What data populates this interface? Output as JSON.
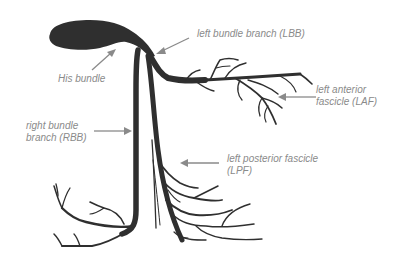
{
  "diagram": {
    "colors": {
      "structure": "#2f2f2f",
      "label_text": "#8a8a8a",
      "arrow": "#8a8a8a",
      "background": "#ffffff"
    },
    "labels": {
      "his_bundle": "His bundle",
      "lbb": "left bundle branch (LBB)",
      "laf": "left anterior\nfascicle (LAF)",
      "rbb": "right bundle\nbranch (RBB)",
      "lpf": "left posterior fascicle\n(LPF)"
    },
    "annotations": [
      {
        "id": "his_bundle",
        "text": "His bundle",
        "arrow_direction": "up-right"
      },
      {
        "id": "lbb",
        "text": "left bundle branch (LBB)",
        "arrow_direction": "down-left"
      },
      {
        "id": "laf",
        "text": "left anterior fascicle (LAF)",
        "arrow_direction": "left"
      },
      {
        "id": "rbb",
        "text": "right bundle branch (RBB)",
        "arrow_direction": "right"
      },
      {
        "id": "lpf",
        "text": "left posterior fascicle (LPF)",
        "arrow_direction": "left"
      }
    ]
  }
}
